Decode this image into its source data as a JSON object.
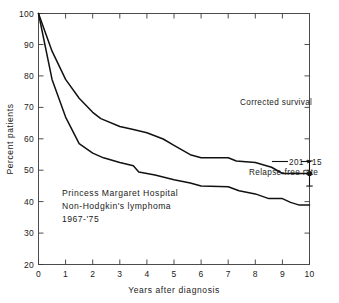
{
  "chart_data": {
    "type": "line",
    "title": "",
    "xlabel": "Years after diagnosis",
    "ylabel": "Percent patients",
    "xlim": [
      0,
      10
    ],
    "ylim": [
      20,
      100
    ],
    "xticks": [
      "0",
      "1",
      "2",
      "3",
      "4",
      "5",
      "6",
      "7",
      "8",
      "9",
      "10"
    ],
    "yticks": [
      "20",
      "30",
      "40",
      "50",
      "60",
      "70",
      "80",
      "90",
      "100"
    ],
    "grid": false,
    "legend_position": "inline-annotations",
    "series": [
      {
        "name": "Corrected survival",
        "color": "#111111",
        "points": [
          [
            0.0,
            100
          ],
          [
            0.5,
            88
          ],
          [
            1.0,
            79
          ],
          [
            1.5,
            73
          ],
          [
            2.0,
            68.5
          ],
          [
            2.3,
            66.5
          ],
          [
            3.0,
            64
          ],
          [
            3.5,
            63
          ],
          [
            4.0,
            62
          ],
          [
            4.6,
            60
          ],
          [
            5.0,
            58
          ],
          [
            5.6,
            55
          ],
          [
            6.0,
            54
          ],
          [
            7.0,
            54
          ],
          [
            7.3,
            53
          ],
          [
            8.0,
            52.5
          ],
          [
            8.6,
            51
          ],
          [
            9.0,
            49
          ],
          [
            10.0,
            49
          ]
        ]
      },
      {
        "name": "Relapse-free rate",
        "color": "#111111",
        "points": [
          [
            0.0,
            100
          ],
          [
            0.5,
            79
          ],
          [
            1.0,
            67
          ],
          [
            1.5,
            58.5
          ],
          [
            2.0,
            55.5
          ],
          [
            2.4,
            54
          ],
          [
            3.0,
            52.5
          ],
          [
            3.5,
            51.5
          ],
          [
            3.7,
            49.5
          ],
          [
            4.3,
            48.5
          ],
          [
            5.0,
            47
          ],
          [
            5.6,
            46
          ],
          [
            6.0,
            45
          ],
          [
            7.0,
            44.8
          ],
          [
            7.4,
            43.5
          ],
          [
            8.0,
            42.5
          ],
          [
            8.5,
            41
          ],
          [
            9.0,
            41
          ],
          [
            9.3,
            39.8
          ],
          [
            9.6,
            39
          ],
          [
            10.0,
            39
          ]
        ]
      }
    ],
    "error_bars": [
      {
        "series": "Corrected survival",
        "x": 10,
        "y": 49,
        "low": 45,
        "high": 53
      }
    ],
    "annotations": [
      {
        "name": "corrected-survival-label",
        "text": "Corrected survival",
        "x": 10,
        "y": 56
      },
      {
        "name": "relapse-free-rate-label",
        "text": "Relapse-free rate",
        "x": 10,
        "y": 36.5
      },
      {
        "name": "numbers-at-risk-label",
        "text": "201",
        "x": 10,
        "y": 39.5
      },
      {
        "name": "numbers-at-risk-arrow",
        "text": "→",
        "x": 10,
        "y": 39.5
      },
      {
        "name": "numbers-at-risk-end",
        "text": "15",
        "x": 10,
        "y": 39.5
      }
    ],
    "caption_block": {
      "line1": "Princess Margaret Hospital",
      "line2": "Non-Hodgkin's lymphoma",
      "line3": "1967-'75"
    }
  }
}
